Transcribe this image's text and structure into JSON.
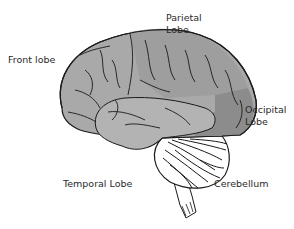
{
  "diagram": {
    "labels": {
      "frontal": "Front lobe",
      "parietal_line1": "Parietal",
      "parietal_line2": "Lobe",
      "occipital_line1": "Occipital",
      "occipital_line2": "Lobe",
      "temporal": "Temporal Lobe",
      "cerebellum": "Cerebellum"
    },
    "colors": {
      "frontal": "#a9a9a9",
      "parietal": "#9e9e9e",
      "temporal": "#b3b3b3",
      "occipital": "#8c8c8c",
      "outline": "#1a1a1a",
      "cerebellum": "#ffffff",
      "text": "#2a2a2a"
    }
  }
}
